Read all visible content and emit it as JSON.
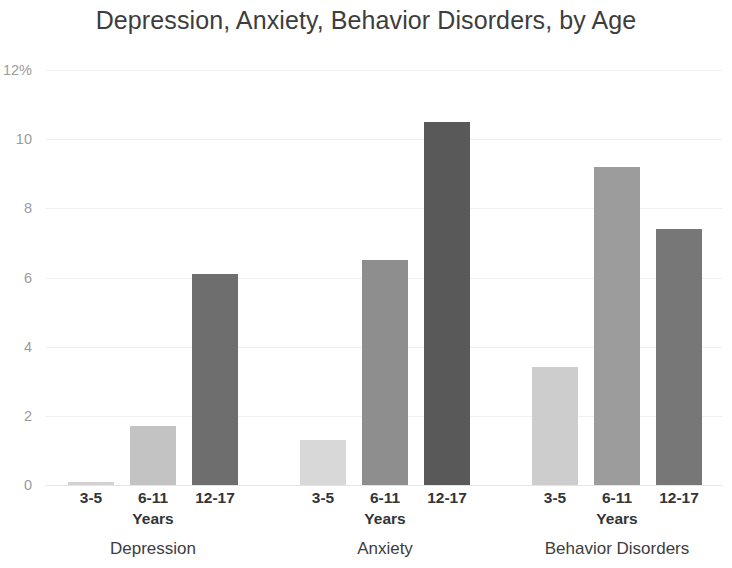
{
  "chart_data": {
    "type": "bar",
    "title": "Depression, Anxiety, Behavior Disorders, by Age",
    "xlabel": "Years",
    "ylabel": "",
    "ylim": [
      0,
      12
    ],
    "yticks": [
      {
        "value": 12,
        "label": "12%"
      },
      {
        "value": 10,
        "label": "10"
      },
      {
        "value": 8,
        "label": "8"
      },
      {
        "value": 6,
        "label": "6"
      },
      {
        "value": 4,
        "label": "4"
      },
      {
        "value": 2,
        "label": "2"
      },
      {
        "value": 0,
        "label": "0"
      }
    ],
    "grid": true,
    "legend": "none",
    "categories": [
      "3-5",
      "6-11",
      "12-17"
    ],
    "category_axis_title": "Years",
    "groups": [
      {
        "name": "Depression",
        "bars": [
          {
            "category": "3-5",
            "value": 0.1,
            "color": "#d2d2d2"
          },
          {
            "category": "6-11",
            "value": 1.7,
            "color": "#c3c3c3"
          },
          {
            "category": "12-17",
            "value": 6.1,
            "color": "#6e6e6e"
          }
        ]
      },
      {
        "name": "Anxiety",
        "bars": [
          {
            "category": "3-5",
            "value": 1.3,
            "color": "#d8d8d8"
          },
          {
            "category": "6-11",
            "value": 6.5,
            "color": "#8e8e8e"
          },
          {
            "category": "12-17",
            "value": 10.5,
            "color": "#595959"
          }
        ]
      },
      {
        "name": "Behavior Disorders",
        "bars": [
          {
            "category": "3-5",
            "value": 3.4,
            "color": "#cdcdcd"
          },
          {
            "category": "6-11",
            "value": 9.2,
            "color": "#9c9c9c"
          },
          {
            "category": "12-17",
            "value": 7.4,
            "color": "#777777"
          }
        ]
      }
    ]
  },
  "axis": {
    "y_labels": [
      "12%",
      "10",
      "8",
      "6",
      "4",
      "2",
      "0"
    ],
    "years_label": "Years"
  },
  "groups_flat": {
    "g0_name": "Depression",
    "g1_name": "Anxiety",
    "g2_name": "Behavior Disorders"
  },
  "ticks_flat": {
    "t0": "3-5",
    "t1": "6-11",
    "t2": "12-17",
    "t3": "3-5",
    "t4": "6-11",
    "t5": "12-17",
    "t6": "3-5",
    "t7": "6-11",
    "t8": "12-17"
  }
}
